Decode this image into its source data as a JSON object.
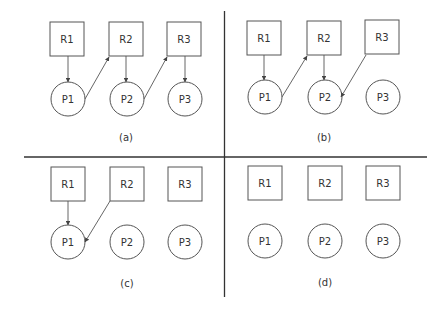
{
  "panels": [
    {
      "caption": "(a)",
      "resources": [
        {
          "label": "R1"
        },
        {
          "label": "R2"
        },
        {
          "label": "R3"
        }
      ],
      "processes": [
        {
          "label": "P1"
        },
        {
          "label": "P2"
        },
        {
          "label": "P3"
        }
      ],
      "edges": [
        {
          "from": "R1",
          "to": "P1"
        },
        {
          "from": "P1",
          "to": "R2"
        },
        {
          "from": "R2",
          "to": "P2"
        },
        {
          "from": "P2",
          "to": "R3"
        },
        {
          "from": "R3",
          "to": "P3"
        }
      ]
    },
    {
      "caption": "(b)",
      "resources": [
        {
          "label": "R1"
        },
        {
          "label": "R2"
        },
        {
          "label": "R3"
        }
      ],
      "processes": [
        {
          "label": "P1"
        },
        {
          "label": "P2"
        },
        {
          "label": "P3"
        }
      ],
      "edges": [
        {
          "from": "R1",
          "to": "P1"
        },
        {
          "from": "P1",
          "to": "R2"
        },
        {
          "from": "R2",
          "to": "P2"
        },
        {
          "from": "R3",
          "to": "P2"
        }
      ]
    },
    {
      "caption": "(c)",
      "resources": [
        {
          "label": "R1"
        },
        {
          "label": "R2"
        },
        {
          "label": "R3"
        }
      ],
      "processes": [
        {
          "label": "P1"
        },
        {
          "label": "P2"
        },
        {
          "label": "P3"
        }
      ],
      "edges": [
        {
          "from": "R1",
          "to": "P1"
        },
        {
          "from": "R2",
          "to": "P1"
        }
      ]
    },
    {
      "caption": "(d)",
      "resources": [
        {
          "label": "R1"
        },
        {
          "label": "R2"
        },
        {
          "label": "R3"
        }
      ],
      "processes": [
        {
          "label": "P1"
        },
        {
          "label": "P2"
        },
        {
          "label": "P3"
        }
      ],
      "edges": []
    }
  ]
}
